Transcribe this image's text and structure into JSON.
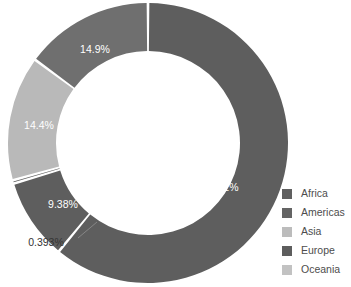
{
  "chart_data": {
    "type": "pie",
    "variant": "donut",
    "title": "",
    "subtitle": "",
    "xlabel": "",
    "ylabel": "",
    "grid": false,
    "legend_position": "right",
    "start_angle_deg": 0,
    "direction": "clockwise",
    "inner_radius_ratio": 0.66,
    "categories": [
      "Africa",
      "Americas",
      "Europe",
      "Asia",
      "Oceania"
    ],
    "values": [
      61,
      9.38,
      0.393,
      14.4,
      14.9
    ],
    "value_labels": [
      "61%",
      "9.38%",
      "0.393%",
      "14.4%",
      "14.9%"
    ],
    "label_placement": [
      "inside",
      "inside",
      "outside",
      "inside",
      "inside"
    ],
    "colors": [
      "#5e5e5e",
      "#5e5e5e",
      "#5e5e5e",
      "#b9b9b9",
      "#6f6f6f"
    ],
    "slices": [
      {
        "name": "Africa",
        "value": 61,
        "label": "61%",
        "color": "#5e5e5e",
        "placement": "inside"
      },
      {
        "name": "Americas",
        "value": 9.38,
        "label": "9.38%",
        "color": "#5e5e5e",
        "placement": "inside"
      },
      {
        "name": "Europe",
        "value": 0.393,
        "label": "0.393%",
        "color": "#5e5e5e",
        "placement": "outside"
      },
      {
        "name": "Asia",
        "value": 14.4,
        "label": "14.4%",
        "color": "#b9b9b9",
        "placement": "inside"
      },
      {
        "name": "Oceania",
        "value": 14.9,
        "label": "14.9%",
        "color": "#6f6f6f",
        "placement": "inside"
      }
    ]
  },
  "legend": {
    "items": [
      {
        "label": "Africa",
        "color": "#606060"
      },
      {
        "label": "Americas",
        "color": "#646464"
      },
      {
        "label": "Asia",
        "color": "#bcbcbc"
      },
      {
        "label": "Europe",
        "color": "#5d5d5d"
      },
      {
        "label": "Oceania",
        "color": "#c2c2c2"
      }
    ]
  },
  "geometry": {
    "cx": 148,
    "cy": 143,
    "outer_r": 140,
    "inner_r": 92,
    "gap_deg": 1.1
  },
  "slice_labels": [
    {
      "text": "61%",
      "x": 228,
      "y": 188,
      "placement": "inside"
    },
    {
      "text": "9.38%",
      "x": 63,
      "y": 205,
      "placement": "inside"
    },
    {
      "text": "0.393%",
      "x": 46,
      "y": 243,
      "placement": "outside"
    },
    {
      "text": "14.4%",
      "x": 39,
      "y": 126,
      "placement": "inside"
    },
    {
      "text": "14.9%",
      "x": 95,
      "y": 50,
      "placement": "inside"
    }
  ],
  "leader_line": {
    "x1": 78,
    "y1": 238,
    "x2": 97,
    "y2": 222
  }
}
